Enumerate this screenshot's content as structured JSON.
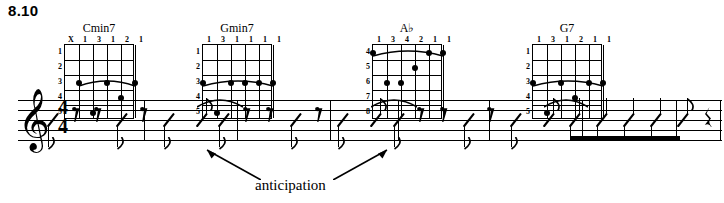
{
  "example_number": "8.10",
  "chords": [
    {
      "name": "Cmin7",
      "fingering": [
        "X",
        "1",
        "3",
        "1",
        "2",
        "1"
      ],
      "fret_labels": [
        "1",
        "2",
        "3",
        "4",
        "5"
      ],
      "barre_fret": 3,
      "barre_from_string": 2,
      "barre_to_string": 6,
      "dots": [
        {
          "string": 2,
          "fret": 3
        },
        {
          "string": 4,
          "fret": 3
        },
        {
          "string": 5,
          "fret": 4
        },
        {
          "string": 6,
          "fret": 3
        },
        {
          "string": 3,
          "fret": 5
        }
      ],
      "left": 50
    },
    {
      "name": "Gmin7",
      "fingering": [
        "1",
        "3",
        "1",
        "1",
        "1",
        "1"
      ],
      "fret_labels": [
        "1",
        "2",
        "3",
        "4",
        "5"
      ],
      "barre_fret": 3,
      "barre_from_string": 1,
      "barre_to_string": 6,
      "dots": [
        {
          "string": 1,
          "fret": 3
        },
        {
          "string": 3,
          "fret": 3
        },
        {
          "string": 4,
          "fret": 3
        },
        {
          "string": 5,
          "fret": 3
        },
        {
          "string": 6,
          "fret": 3
        },
        {
          "string": 2,
          "fret": 5
        }
      ],
      "left": 188
    },
    {
      "name": "A♭",
      "fingering": [
        "1",
        "3",
        "4",
        "2",
        "1",
        "1"
      ],
      "fret_labels": [
        "4",
        "5",
        "6",
        "7",
        "8"
      ],
      "barre_fret": 4,
      "barre_from_string": 1,
      "barre_to_string": 6,
      "dots": [
        {
          "string": 1,
          "fret": 4
        },
        {
          "string": 5,
          "fret": 4
        },
        {
          "string": 6,
          "fret": 4
        },
        {
          "string": 4,
          "fret": 5
        },
        {
          "string": 2,
          "fret": 6
        },
        {
          "string": 3,
          "fret": 6
        }
      ],
      "left": 358
    },
    {
      "name": "G7",
      "fingering": [
        "1",
        "3",
        "1",
        "2",
        "1",
        "1"
      ],
      "fret_labels": [
        "1",
        "2",
        "3",
        "4",
        "5"
      ],
      "barre_fret": 3,
      "barre_from_string": 1,
      "barre_to_string": 6,
      "dots": [
        {
          "string": 1,
          "fret": 3
        },
        {
          "string": 3,
          "fret": 3
        },
        {
          "string": 5,
          "fret": 3
        },
        {
          "string": 6,
          "fret": 3
        },
        {
          "string": 4,
          "fret": 4
        },
        {
          "string": 2,
          "fret": 5
        }
      ],
      "left": 518
    }
  ],
  "staff": {
    "clef": "treble-clef",
    "time_signature": {
      "beats": "4",
      "beat_value": "4"
    },
    "notation_style": "rhythm-slash",
    "barline_positions": [
      144,
      237,
      330,
      398,
      489,
      582,
      676,
      720
    ],
    "measures": [
      {
        "index": 1,
        "pattern": "8th-slash, 8th-rest, 8th-rest, 8th-slash, 8th-rest, 8th-slash(tied)"
      },
      {
        "index": 2,
        "pattern": "8th-slash, 8th-slash, 8th-rest, 8th-rest, 8th-slash, 8th-rest"
      },
      {
        "index": 3,
        "pattern": "8th-slash(tied), 8th-slash, 8th-slash, 8th-rest, 8th-rest"
      },
      {
        "index": 4,
        "pattern": "8th-slash, 8th-rest, 8th-slash(tied), beamed 8th-slashes, quarter-rest"
      }
    ],
    "ties": [
      {
        "label": "anticipation",
        "over_barline": 237
      },
      {
        "label": "anticipation",
        "over_barline": 489
      }
    ]
  },
  "annotation": {
    "label": "anticipation",
    "arrow_targets": [
      "first-anticipation-tie",
      "second-anticipation-tie"
    ]
  }
}
